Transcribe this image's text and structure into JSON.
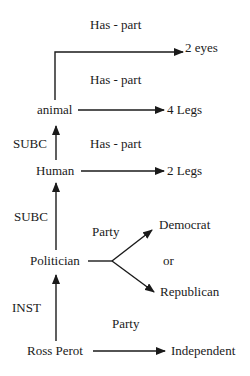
{
  "diagram": {
    "type": "semantic-network",
    "nodes": {
      "two_eyes": "2 eyes",
      "animal": "animal",
      "four_legs": "4 Legs",
      "human": "Human",
      "two_legs": "2 Legs",
      "politician": "Politician",
      "democrat": "Democrat",
      "or": "or",
      "republican": "Republican",
      "ross_perot": "Ross Perot",
      "independent": "Independent"
    },
    "edge_labels": {
      "animal_eyes": "Has - part",
      "animal_legs": "Has - part",
      "human_legs": "Has - part",
      "human_animal": "SUBC",
      "politician_human": "SUBC",
      "politician_party": "Party",
      "perot_politician": "INST",
      "perot_party": "Party"
    },
    "edges": [
      {
        "from": "animal",
        "to": "2 eyes",
        "label": "Has - part"
      },
      {
        "from": "animal",
        "to": "4 Legs",
        "label": "Has - part"
      },
      {
        "from": "Human",
        "to": "animal",
        "label": "SUBC"
      },
      {
        "from": "Human",
        "to": "2 Legs",
        "label": "Has - part"
      },
      {
        "from": "Politician",
        "to": "Human",
        "label": "SUBC"
      },
      {
        "from": "Politician",
        "to": "Democrat",
        "label": "Party"
      },
      {
        "from": "Politician",
        "to": "Republican",
        "label": "Party"
      },
      {
        "from": "Ross Perot",
        "to": "Politician",
        "label": "INST"
      },
      {
        "from": "Ross Perot",
        "to": "Independent",
        "label": "Party"
      }
    ]
  }
}
